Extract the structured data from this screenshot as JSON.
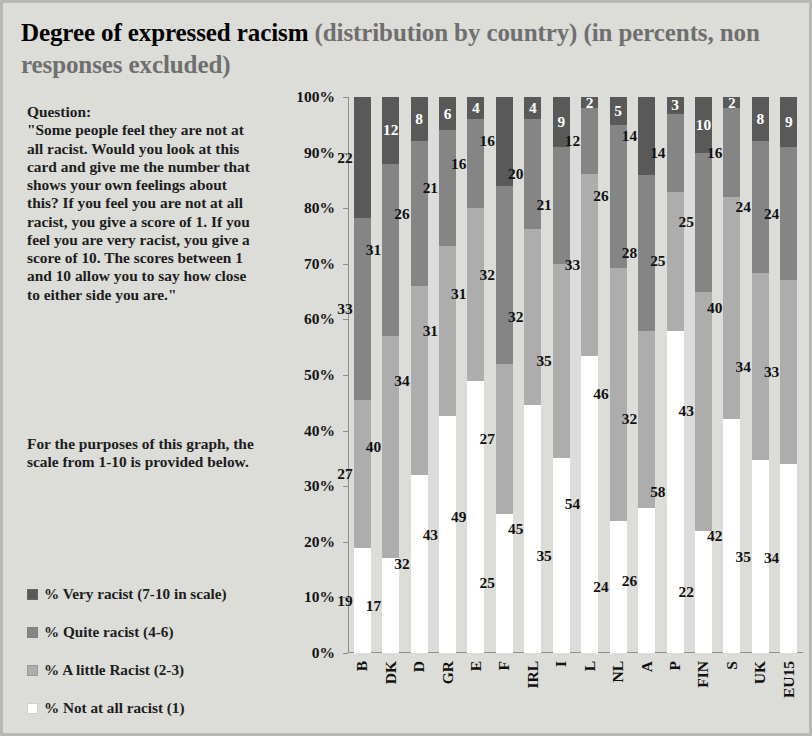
{
  "title": {
    "main": "Degree of expressed racism ",
    "sub": "(distribution by country) (in percents, non responses excluded)"
  },
  "question": {
    "heading": "Question:",
    "body": "\"Some people feel they are not at all racist.  Would you look at this card and give me the number that shows your own feelings about this?  If you feel you are not at all racist, you give a score of 1.  If you feel you are very racist, you give a score of 10.  The scores between 1 and 10 allow you to say how close to either side you are.\""
  },
  "purpose": {
    "body": "For the purposes of this graph, the scale from 1-10 is provided below."
  },
  "legend": {
    "items": [
      {
        "label": "% Very racist (7-10 in scale)",
        "color": "#595959"
      },
      {
        "label": "% Quite racist (4-6)",
        "color": "#858585"
      },
      {
        "label": "% A little Racist (2-3)",
        "color": "#adadad"
      },
      {
        "label": "% Not at all racist (1)",
        "color": "#ffffff"
      }
    ]
  },
  "chart_data": {
    "type": "bar",
    "subtype": "stacked-column-100",
    "title": "Degree of expressed racism (distribution by country) (in percents, non responses excluded)",
    "xlabel": "",
    "ylabel": "",
    "ylim": [
      0,
      100
    ],
    "grid": false,
    "legend_position": "left-bottom",
    "ytick_labels": [
      "100%",
      "90%",
      "80%",
      "70%",
      "60%",
      "50%",
      "40%",
      "30%",
      "20%",
      "10%",
      "0%"
    ],
    "ytick_values": [
      100,
      90,
      80,
      70,
      60,
      50,
      40,
      30,
      20,
      10,
      0
    ],
    "categories": [
      "B",
      "DK",
      "D",
      "GR",
      "E",
      "F",
      "IRL",
      "I",
      "L",
      "NL",
      "A",
      "P",
      "FIN",
      "S",
      "UK",
      "EU15"
    ],
    "series": [
      {
        "name": "% Not at all racist (1)",
        "color": "#ffffff",
        "values": [
          19,
          17,
          32,
          43,
          49,
          25,
          45,
          35,
          54,
          24,
          26,
          58,
          22,
          42,
          35,
          34
        ]
      },
      {
        "name": "% A little Racist (2-3)",
        "color": "#adadad",
        "values": [
          27,
          40,
          34,
          31,
          31,
          27,
          32,
          35,
          33,
          46,
          32,
          25,
          43,
          40,
          34,
          33
        ]
      },
      {
        "name": "% Quite racist (4-6)",
        "color": "#858585",
        "values": [
          33,
          31,
          26,
          21,
          16,
          32,
          20,
          21,
          12,
          26,
          28,
          14,
          25,
          16,
          24,
          24
        ]
      },
      {
        "name": "% Very racist (7-10 in scale)",
        "color": "#595959",
        "values": [
          22,
          12,
          8,
          6,
          4,
          16,
          4,
          9,
          2,
          5,
          14,
          3,
          10,
          2,
          8,
          9
        ]
      }
    ]
  }
}
